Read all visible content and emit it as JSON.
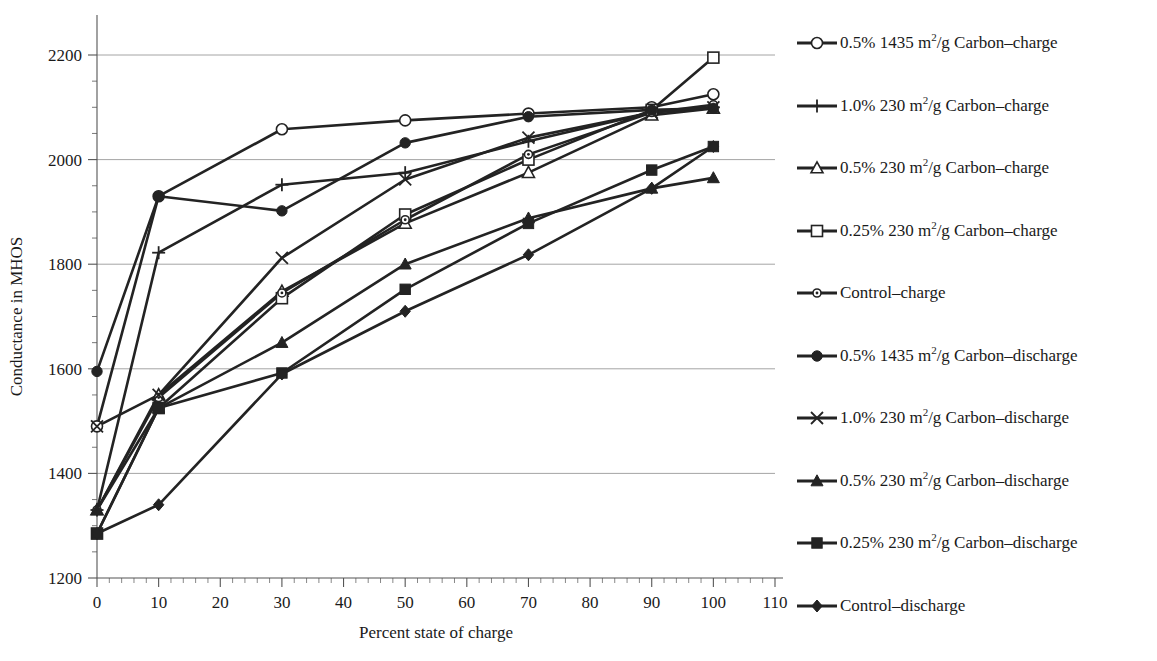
{
  "chart_data": {
    "type": "line",
    "title": "",
    "xlabel": "Percent state of charge",
    "ylabel": "Conductance in MHOS",
    "x": [
      0,
      10,
      30,
      50,
      70,
      90,
      100
    ],
    "xlim": [
      0,
      110
    ],
    "ylim": [
      1200,
      2200
    ],
    "xticks": [
      0,
      10,
      20,
      30,
      40,
      50,
      60,
      70,
      80,
      90,
      100,
      110
    ],
    "yticks": [
      1200,
      1400,
      1600,
      1800,
      2000,
      2200
    ],
    "x_minor_tick_step": 2,
    "y_minor_tick_step": 50,
    "grid": "horizontal-major",
    "legend_position": "right",
    "line_color": "#232323",
    "grid_color": "#9a9a9a",
    "series": [
      {
        "name": "0.5% 1435 m2/g Carbon-charge",
        "label_prefix": "0.5% 1435 m",
        "label_sup": "2",
        "label_suffix": "/g Carbon–charge",
        "marker": "open-circle",
        "values": [
          1490,
          1930,
          2058,
          2075,
          2088,
          2100,
          2125
        ]
      },
      {
        "name": "1.0% 230 m2/g Carbon-charge",
        "label_prefix": "1.0% 230 m",
        "label_sup": "2",
        "label_suffix": "/g Carbon–charge",
        "marker": "plus",
        "values": [
          1330,
          1822,
          1952,
          1975,
          2035,
          2090,
          2100
        ]
      },
      {
        "name": "0.5% 230 m2/g Carbon-charge",
        "label_prefix": "0.5% 230 m",
        "label_sup": "2",
        "label_suffix": "/g Carbon–charge",
        "marker": "open-triangle",
        "values": [
          1330,
          1550,
          1748,
          1878,
          1975,
          2085,
          2098
        ]
      },
      {
        "name": "0.25% 230 m2/g Carbon-charge",
        "label_prefix": "0.25% 230 m",
        "label_sup": "2",
        "label_suffix": "/g Carbon–charge",
        "marker": "open-square",
        "values": [
          1285,
          1525,
          1735,
          1895,
          2000,
          2095,
          2195
        ]
      },
      {
        "name": "Control-charge",
        "label_prefix": "Control–charge",
        "label_sup": "",
        "label_suffix": "",
        "marker": "small-open-circle",
        "values": [
          1330,
          1545,
          1745,
          1885,
          2010,
          2090,
          2105
        ]
      },
      {
        "name": "0.5% 1435 m2/g Carbon-discharge",
        "label_prefix": "0.5% 1435 m",
        "label_sup": "2",
        "label_suffix": "/g Carbon–discharge",
        "marker": "filled-circle",
        "values": [
          1595,
          1930,
          1902,
          2032,
          2082,
          2095,
          2098
        ]
      },
      {
        "name": "1.0% 230 m2/g Carbon-discharge",
        "label_prefix": "1.0% 230 m",
        "label_sup": "2",
        "label_suffix": "/g Carbon–discharge",
        "marker": "x-mark",
        "values": [
          1490,
          1550,
          1812,
          1962,
          2042,
          2090,
          2100
        ]
      },
      {
        "name": "0.5% 230 m2/g Carbon-discharge",
        "label_prefix": "0.5% 230 m",
        "label_sup": "2",
        "label_suffix": "/g Carbon–discharge",
        "marker": "filled-triangle",
        "values": [
          1330,
          1525,
          1650,
          1800,
          1888,
          1945,
          1965
        ]
      },
      {
        "name": "0.25% 230 m2/g Carbon-discharge",
        "label_prefix": "0.25% 230 m",
        "label_sup": "2",
        "label_suffix": "/g Carbon–discharge",
        "marker": "filled-square",
        "values": [
          1285,
          1525,
          1592,
          1752,
          1878,
          1980,
          2025
        ]
      },
      {
        "name": "Control-discharge",
        "label_prefix": "Control–discharge",
        "label_sup": "",
        "label_suffix": "",
        "marker": "filled-diamond",
        "values": [
          1285,
          1340,
          1590,
          1710,
          1818,
          1945,
          2025
        ]
      }
    ]
  },
  "legend": {
    "items": [
      "0.5% 1435 m2/g Carbon–charge",
      "1.0% 230 m2/g Carbon–charge",
      "0.5% 230 m2/g Carbon–charge",
      "0.25% 230 m2/g Carbon–charge",
      "Control–charge",
      "0.5% 1435 m2/g Carbon–discharge",
      "1.0% 230 m2/g Carbon–discharge",
      "0.5% 230 m2/g Carbon–discharge",
      "0.25% 230 m2/g Carbon–discharge",
      "Control–discharge"
    ]
  }
}
